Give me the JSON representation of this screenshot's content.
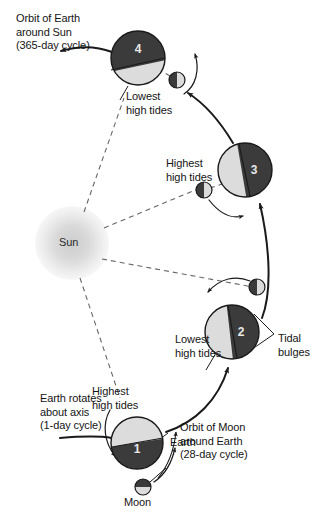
{
  "diagram": {
    "background_color": "#ffffff",
    "colors": {
      "dark_hemisphere": "#3b3b3b",
      "light_hemisphere": "#dcdcdc",
      "outline": "#1a1a1a",
      "orbit_arc": "#1a1a1a",
      "dashed_ray": "#555555",
      "text": "#151515",
      "number_text": "#e8e8e8"
    }
  },
  "sun": {
    "label": "Sun",
    "cx": 72,
    "cy": 243,
    "glow_radius": 37
  },
  "earth_positions": [
    {
      "id": "earth-1",
      "number": "1",
      "cx": 137,
      "cy": 443,
      "r": 26,
      "dark_side": "bottom",
      "tide_label": "Highest\nhigh tides",
      "name_label": "Earth"
    },
    {
      "id": "earth-2",
      "number": "2",
      "cx": 232,
      "cy": 332,
      "r": 27,
      "dark_side": "right",
      "tide_label": "Lowest\nhigh tides",
      "callout_label": "Tidal\nbulges"
    },
    {
      "id": "earth-3",
      "number": "3",
      "cx": 245,
      "cy": 170,
      "r": 27,
      "dark_side": "right",
      "tide_label": "Highest\nhigh tides"
    },
    {
      "id": "earth-4",
      "number": "4",
      "cx": 138,
      "cy": 58,
      "r": 27,
      "dark_side": "top",
      "tide_label": "Lowest\nhigh tides"
    }
  ],
  "moons": [
    {
      "id": "moon-1",
      "cx": 143,
      "cy": 487,
      "r": 8,
      "dark_side": "top",
      "label": "Moon"
    },
    {
      "id": "moon-2",
      "cx": 257,
      "cy": 287,
      "r": 8,
      "dark_side": "left",
      "label": ""
    },
    {
      "id": "moon-3",
      "cx": 204,
      "cy": 190,
      "r": 8,
      "dark_side": "left",
      "label": ""
    },
    {
      "id": "moon-4",
      "cx": 177,
      "cy": 80,
      "r": 8,
      "dark_side": "left",
      "label": ""
    }
  ],
  "annotations": {
    "earth_orbit": {
      "lines": [
        "Orbit of Earth",
        "around Sun",
        "(365-day cycle)"
      ],
      "x": 16,
      "y": 12
    },
    "earth_rotation": {
      "lines": [
        "Earth rotates",
        "about axis",
        "(1-day cycle)"
      ],
      "x": 40,
      "y": 392
    },
    "moon_orbit": {
      "lines": [
        "Orbit of Moon",
        "around Earth",
        "(28-day cycle)"
      ],
      "x": 180,
      "y": 421
    },
    "tidal_bulges": {
      "lines": [
        "Tidal",
        "bulges"
      ],
      "x": 278,
      "y": 332
    },
    "earth_label": {
      "text": "Earth",
      "x": 170,
      "y": 436
    },
    "moon_label": {
      "text": "Moon",
      "x": 124,
      "y": 496
    },
    "tides_1": {
      "lines": [
        "Highest",
        "high tides"
      ],
      "x": 92,
      "y": 385
    },
    "tides_2": {
      "lines": [
        "Lowest",
        "high tides"
      ],
      "x": 175,
      "y": 333
    },
    "tides_3": {
      "lines": [
        "Highest",
        "high tides"
      ],
      "x": 166,
      "y": 157
    },
    "tides_4": {
      "lines": [
        "Lowest",
        "high tides"
      ],
      "x": 126,
      "y": 90
    }
  }
}
